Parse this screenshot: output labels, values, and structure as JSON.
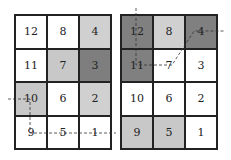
{
  "colors": {
    "white": "#ffffff",
    "light": "#d4d4d4",
    "medium": "#a6a6a6",
    "dark": "#7a7a7a",
    "line": "#222222"
  },
  "left_grid": {
    "cells": [
      {
        "label": "12",
        "shade": "#ffffff"
      },
      {
        "label": "8",
        "shade": "#ffffff"
      },
      {
        "label": "4",
        "shade": "#d0d0d0"
      },
      {
        "label": "11",
        "shade": "#ffffff"
      },
      {
        "label": "7",
        "shade": "#c8c8c8"
      },
      {
        "label": "3",
        "shade": "#7e7e7e"
      },
      {
        "label": "10",
        "shade": "#c8c8c8"
      },
      {
        "label": "6",
        "shade": "#ffffff"
      },
      {
        "label": "2",
        "shade": "#d0d0d0"
      },
      {
        "label": "9",
        "shade": "#ffffff"
      },
      {
        "label": "5",
        "shade": "#ffffff"
      },
      {
        "label": "1",
        "shade": "#ffffff"
      }
    ]
  },
  "right_grid": {
    "cells": [
      {
        "label": "12",
        "shade": "#808080"
      },
      {
        "label": "8",
        "shade": "#d0d0d0"
      },
      {
        "label": "4",
        "shade": "#808080"
      },
      {
        "label": "11",
        "shade": "#808080"
      },
      {
        "label": "7",
        "shade": "#ffffff"
      },
      {
        "label": "3",
        "shade": "#ffffff"
      },
      {
        "label": "10",
        "shade": "#ffffff"
      },
      {
        "label": "6",
        "shade": "#ffffff"
      },
      {
        "label": "2",
        "shade": "#ffffff"
      },
      {
        "label": "9",
        "shade": "#c8c8c8"
      },
      {
        "label": "5",
        "shade": "#c8c8c8"
      },
      {
        "label": "1",
        "shade": "#ffffff"
      }
    ]
  }
}
